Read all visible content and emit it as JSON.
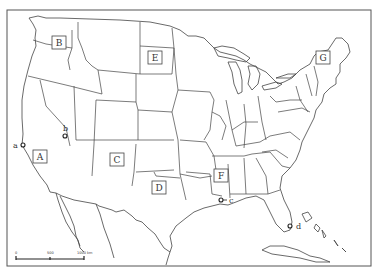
{
  "map": {
    "title": "",
    "region": "United States",
    "region_labels": [
      {
        "id": "A",
        "label": "A",
        "x": 40,
        "y": 157
      },
      {
        "id": "B",
        "label": "B",
        "x": 59,
        "y": 43
      },
      {
        "id": "C",
        "label": "C",
        "x": 117,
        "y": 160
      },
      {
        "id": "D",
        "label": "D",
        "x": 159,
        "y": 188
      },
      {
        "id": "E",
        "label": "E",
        "x": 155,
        "y": 58
      },
      {
        "id": "F",
        "label": "F",
        "x": 221,
        "y": 176
      },
      {
        "id": "G",
        "label": "G",
        "x": 323,
        "y": 58
      }
    ],
    "point_markers": [
      {
        "id": "a",
        "label": "a",
        "x": 23,
        "y": 145
      },
      {
        "id": "b",
        "label": "b",
        "x": 65,
        "y": 136
      },
      {
        "id": "c",
        "label": "c",
        "x": 221,
        "y": 200
      },
      {
        "id": "d",
        "label": "d",
        "x": 290,
        "y": 226
      }
    ],
    "scale_bar": {
      "ticks": [
        "0",
        "500",
        "1000 km"
      ]
    }
  }
}
